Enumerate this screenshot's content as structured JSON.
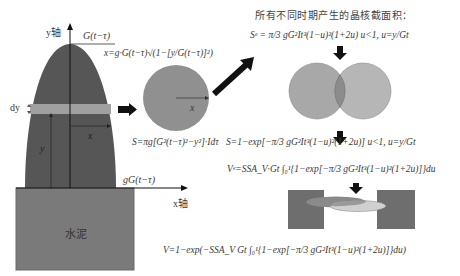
{
  "colors": {
    "crystal_dark": "#565656",
    "cement": "#7a7a7a",
    "slice_band": "#9c9c9c",
    "circle": "#909090",
    "venn_left": "#a6a6a6",
    "venn_right": "#b4b4b4",
    "venn_overlap": "#8a8a8a",
    "arrow": "#111111",
    "block_dark": "#6e6e6e"
  },
  "left_panel": {
    "y_axis_label": "y轴",
    "x_axis_label": "x轴",
    "top_label": "G(t−τ)",
    "dy_label": "dy",
    "x_label": "x",
    "y_label": "y",
    "base_label": "gG(t−τ)",
    "cement_label": "水泥"
  },
  "middle_panel": {
    "x_formula": "x=g·G(t−τ)√(1−[y/G(t−τ)]²)",
    "circle_radius_label": "x",
    "area_formula": "S=πg[G²(t−τ)²−y²]·Idτ"
  },
  "right_panel": {
    "title": "所有不同时期产生的晶核截面积：",
    "se_formula": "Sᵉ = π/3 gG²It³(1−u)²(1+2u)   u<1, u=y/Gt",
    "s_formula": "S=1−exp[−π/3 gG²It³(1−u)²(1+2u)]   u<1, u=y/Gt",
    "ve_formula": "Vᵉ=SSA_V·Gt ∫₀¹{1−exp[−π/3 gG²It³(1−u)²(1+2u)]}du",
    "v_formula": "V=1−exp(−SSA_V Gt ∫₀¹{1−exp[−π/3 gG²It³(1−u)²(1+2u)]}du)"
  }
}
